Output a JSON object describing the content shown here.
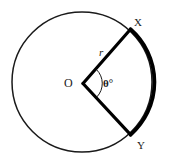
{
  "figure": {
    "type": "circle-sector-diagram",
    "background_color": "#ffffff",
    "stroke_color": "#1a1a1a",
    "labels": {
      "point_x": "X",
      "point_y": "Y",
      "center": "O",
      "radius": "r",
      "angle": "θ°"
    },
    "geometry": {
      "center_x": 82,
      "center_y": 82,
      "radius": 70,
      "point_x_coords": "130,30",
      "point_y_coords": "133,138",
      "thin_circle_stroke_width": 1.5,
      "thick_arc_stroke_width": 3.6,
      "radius_stroke_width": 3.2,
      "angle_marker_radius": 18
    }
  }
}
